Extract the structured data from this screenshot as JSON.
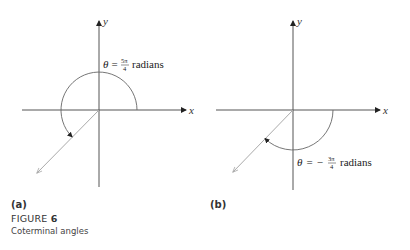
{
  "figure": {
    "number": "6",
    "title_prefix": "FIGURE",
    "caption": "Coterminal angles"
  },
  "panels": [
    {
      "label": "(a)",
      "x_axis_label": "x",
      "y_axis_label": "y",
      "angle_label": {
        "theta": "θ",
        "equals": "=",
        "sign": "",
        "numerator": "5π",
        "denominator": "4",
        "unit": "radians"
      },
      "angle_radians": "5π/4",
      "direction": "counterclockwise"
    },
    {
      "label": "(b)",
      "x_axis_label": "x",
      "y_axis_label": "y",
      "angle_label": {
        "theta": "θ",
        "equals": "=",
        "sign": "−",
        "numerator": "3π",
        "denominator": "4",
        "unit": "radians"
      },
      "angle_radians": "-3π/4",
      "direction": "clockwise"
    }
  ],
  "colors": {
    "axis": "#555555",
    "terminal_ray": "#aaaaaa",
    "text": "#333333"
  }
}
